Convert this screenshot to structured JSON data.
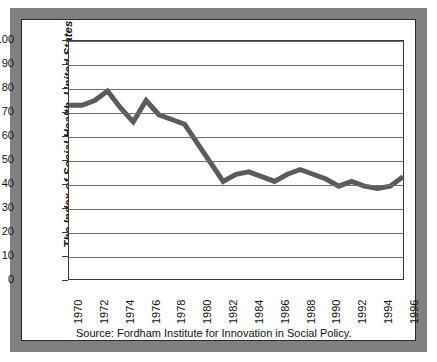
{
  "figure": {
    "frame_color": "#808080",
    "card_background": "#ffffff",
    "source_note": "Source: Fordham Institute for Innovation in Social Policy."
  },
  "chart_data": {
    "type": "line",
    "title": "",
    "subtitle": "",
    "xlabel": "",
    "ylabel": "The Index of Social Health, United States",
    "series_name": "Index of Social Health",
    "line_color": "#5b5b5b",
    "line_width": 5,
    "grid": "horizontal",
    "legend": "none",
    "xlim": [
      1970,
      1996
    ],
    "ylim": [
      0,
      100
    ],
    "yticks": [
      0,
      10,
      20,
      30,
      40,
      50,
      60,
      70,
      80,
      90,
      100
    ],
    "ytick_labels": [
      "0",
      "10",
      "20",
      "30",
      "40",
      "50",
      "60",
      "70",
      "80",
      "90",
      "100"
    ],
    "xticks": [
      1970,
      1972,
      1974,
      1976,
      1978,
      1980,
      1982,
      1984,
      1986,
      1988,
      1990,
      1992,
      1994,
      1996
    ],
    "xtick_labels": [
      "1970",
      "1972",
      "1974",
      "1976",
      "1978",
      "1980",
      "1982",
      "1984",
      "1986",
      "1988",
      "1990",
      "1992",
      "1994",
      "1996"
    ],
    "x": [
      1970,
      1971,
      1972,
      1973,
      1974,
      1975,
      1976,
      1977,
      1978,
      1979,
      1980,
      1981,
      1982,
      1983,
      1984,
      1985,
      1986,
      1987,
      1988,
      1989,
      1990,
      1991,
      1992,
      1993,
      1994,
      1995,
      1996
    ],
    "values": [
      73,
      73,
      75,
      79,
      72,
      66,
      75,
      69,
      67,
      65,
      57,
      49,
      41,
      44,
      45,
      43,
      41,
      44,
      46,
      44,
      42,
      39,
      41,
      39,
      38,
      39,
      43
    ]
  },
  "axis": {
    "y_title": "The Index of Social Health, United States"
  }
}
